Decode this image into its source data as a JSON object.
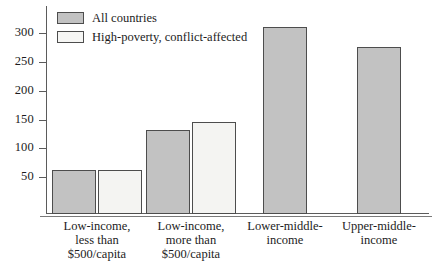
{
  "chart_data": {
    "type": "bar",
    "title": "",
    "xlabel": "",
    "ylabel": "",
    "ylim": [
      0,
      330
    ],
    "yticks": [
      50,
      100,
      150,
      200,
      250,
      300
    ],
    "grid": false,
    "legend_position": "top-left",
    "categories": [
      "Low-income,\nless than\n$500/capita",
      "Low-income,\nmore than\n$500/capita",
      "Lower-middle-\nincome",
      "Upper-middle-\nincome"
    ],
    "series": [
      {
        "name": "All countries",
        "color": "#c2c2c2",
        "values": [
          64,
          133,
          312,
          278
        ]
      },
      {
        "name": "High-poverty, conflict-affected",
        "color": "#f4f4f2",
        "values": [
          64,
          147,
          null,
          null
        ]
      }
    ]
  },
  "legend": {
    "items": [
      {
        "label": "All countries",
        "swatch": "all"
      },
      {
        "label": "High-poverty, conflict-affected",
        "swatch": "hpca"
      }
    ]
  },
  "axis": {
    "y": {
      "ticks": [
        {
          "label": "300",
          "value": 300
        },
        {
          "label": "250",
          "value": 250
        },
        {
          "label": "200",
          "value": 200
        },
        {
          "label": "150",
          "value": 150
        },
        {
          "label": "100",
          "value": 100
        },
        {
          "label": "50",
          "value": 50
        }
      ]
    },
    "x": {
      "labels": [
        "Low-income,\nless than\n$500/capita",
        "Low-income,\nmore than\n$500/capita",
        "Lower-middle-\nincome",
        "Upper-middle-\nincome"
      ]
    }
  }
}
